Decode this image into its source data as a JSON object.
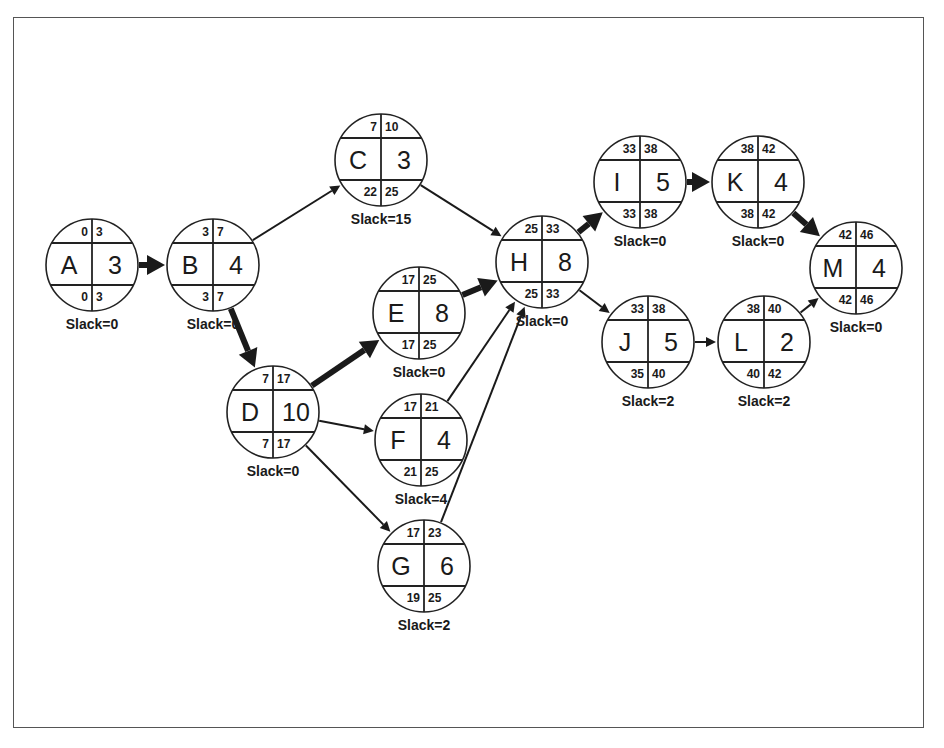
{
  "diagram": {
    "type": "activity-on-node network (critical path)",
    "colors": {
      "line": "#1a1a1a",
      "frame": "#555555",
      "background": "#ffffff"
    },
    "nodes": [
      {
        "id": "A",
        "duration": "3",
        "es": "0",
        "ef": "3",
        "ls": "0",
        "lf": "3",
        "slack_label": "Slack=0",
        "cx": 92,
        "cy": 265
      },
      {
        "id": "B",
        "duration": "4",
        "es": "3",
        "ef": "7",
        "ls": "3",
        "lf": "7",
        "slack_label": "Slack=0",
        "cx": 213,
        "cy": 265
      },
      {
        "id": "C",
        "duration": "3",
        "es": "7",
        "ef": "10",
        "ls": "22",
        "lf": "25",
        "slack_label": "Slack=15",
        "cx": 381,
        "cy": 160
      },
      {
        "id": "D",
        "duration": "10",
        "es": "7",
        "ef": "17",
        "ls": "7",
        "lf": "17",
        "slack_label": "Slack=0",
        "cx": 273,
        "cy": 412
      },
      {
        "id": "E",
        "duration": "8",
        "es": "17",
        "ef": "25",
        "ls": "17",
        "lf": "25",
        "slack_label": "Slack=0",
        "cx": 419,
        "cy": 313
      },
      {
        "id": "F",
        "duration": "4",
        "es": "17",
        "ef": "21",
        "ls": "21",
        "lf": "25",
        "slack_label": "Slack=4",
        "cx": 421,
        "cy": 440
      },
      {
        "id": "G",
        "duration": "6",
        "es": "17",
        "ef": "23",
        "ls": "19",
        "lf": "25",
        "slack_label": "Slack=2",
        "cx": 424,
        "cy": 566
      },
      {
        "id": "H",
        "duration": "8",
        "es": "25",
        "ef": "33",
        "ls": "25",
        "lf": "33",
        "slack_label": "Slack=0",
        "cx": 542,
        "cy": 262
      },
      {
        "id": "I",
        "duration": "5",
        "es": "33",
        "ef": "38",
        "ls": "33",
        "lf": "38",
        "slack_label": "Slack=0",
        "cx": 640,
        "cy": 182
      },
      {
        "id": "K",
        "duration": "4",
        "es": "38",
        "ef": "42",
        "ls": "38",
        "lf": "42",
        "slack_label": "Slack=0",
        "cx": 758,
        "cy": 182
      },
      {
        "id": "J",
        "duration": "5",
        "es": "33",
        "ef": "38",
        "ls": "35",
        "lf": "40",
        "slack_label": "Slack=2",
        "cx": 648,
        "cy": 342
      },
      {
        "id": "L",
        "duration": "2",
        "es": "38",
        "ef": "40",
        "ls": "40",
        "lf": "42",
        "slack_label": "Slack=2",
        "cx": 764,
        "cy": 342
      },
      {
        "id": "M",
        "duration": "4",
        "es": "42",
        "ef": "46",
        "ls": "42",
        "lf": "46",
        "slack_label": "Slack=0",
        "cx": 856,
        "cy": 268
      }
    ],
    "edges": [
      {
        "from": "A",
        "to": "B",
        "critical": true
      },
      {
        "from": "B",
        "to": "C",
        "critical": false
      },
      {
        "from": "B",
        "to": "D",
        "critical": true
      },
      {
        "from": "C",
        "to": "H",
        "critical": false
      },
      {
        "from": "D",
        "to": "E",
        "critical": true
      },
      {
        "from": "D",
        "to": "F",
        "critical": false
      },
      {
        "from": "D",
        "to": "G",
        "critical": false
      },
      {
        "from": "E",
        "to": "H",
        "critical": true
      },
      {
        "from": "F",
        "to": "H",
        "critical": false
      },
      {
        "from": "G",
        "to": "H",
        "critical": false
      },
      {
        "from": "H",
        "to": "I",
        "critical": true
      },
      {
        "from": "H",
        "to": "J",
        "critical": false
      },
      {
        "from": "I",
        "to": "K",
        "critical": true
      },
      {
        "from": "K",
        "to": "M",
        "critical": true
      },
      {
        "from": "J",
        "to": "L",
        "critical": false
      },
      {
        "from": "L",
        "to": "M",
        "critical": false
      }
    ]
  }
}
